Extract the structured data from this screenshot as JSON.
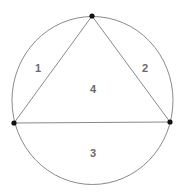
{
  "diagram": {
    "colors": {
      "background": "#ffffff",
      "stroke": "#8a8a8a",
      "vertex": "#111111",
      "label": "#6a6a6a"
    },
    "circle": {
      "cx": 92.5,
      "cy": 100.5,
      "rx": 80.5,
      "ry": 84
    },
    "vertices": [
      {
        "name": "top",
        "x": 92,
        "y": 16
      },
      {
        "name": "left",
        "x": 14,
        "y": 123
      },
      {
        "name": "right",
        "x": 170,
        "y": 122
      }
    ],
    "regions": [
      {
        "id": "1",
        "label": "1",
        "x": 38,
        "y": 72
      },
      {
        "id": "2",
        "label": "2",
        "x": 145,
        "y": 72
      },
      {
        "id": "3",
        "label": "3",
        "x": 93,
        "y": 157
      },
      {
        "id": "4",
        "label": "4",
        "x": 93,
        "y": 93
      }
    ]
  }
}
